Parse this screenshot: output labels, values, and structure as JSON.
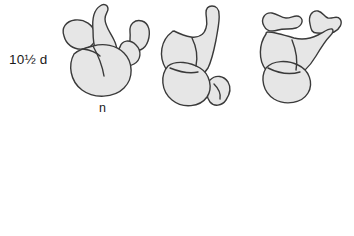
{
  "figure": {
    "background_color": "#ffffff",
    "shape_fill_color": "#e6e6e6",
    "shape_outline_color": "#3a3a3a",
    "text_color": "#1a1a1a"
  },
  "rows": [
    {
      "stage_label": "10½ d",
      "node_label": "n",
      "specimens": [
        {
          "view": "left-lateral"
        },
        {
          "view": "ventral"
        },
        {
          "view": "right-lateral"
        }
      ]
    },
    {
      "stage_label": "9½ d",
      "node_label": "n",
      "specimens": [
        {
          "view": "left-lateral"
        },
        {
          "view": "ventral"
        },
        {
          "view": "right-lateral"
        }
      ]
    }
  ]
}
